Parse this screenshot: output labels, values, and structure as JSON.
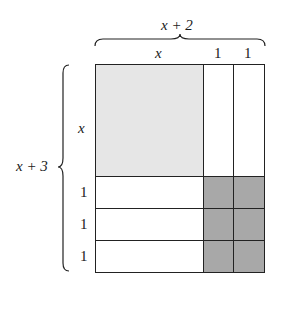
{
  "diagram": {
    "width_total_label": "x + 2",
    "height_total_label": "x + 3",
    "column_labels": [
      "x",
      "1",
      "1"
    ],
    "row_labels": [
      "x",
      "1",
      "1",
      "1"
    ],
    "tiles": {
      "x_squared": {
        "count": 1,
        "color": "#e6e6e6"
      },
      "x_rect": {
        "count": 5,
        "color": "#ffffff"
      },
      "unit_square": {
        "count": 6,
        "color": "#a8a8a8"
      }
    },
    "colors": {
      "line": "#222222",
      "light_fill": "#e6e6e6",
      "dark_fill": "#a8a8a8",
      "white_fill": "#ffffff"
    }
  }
}
